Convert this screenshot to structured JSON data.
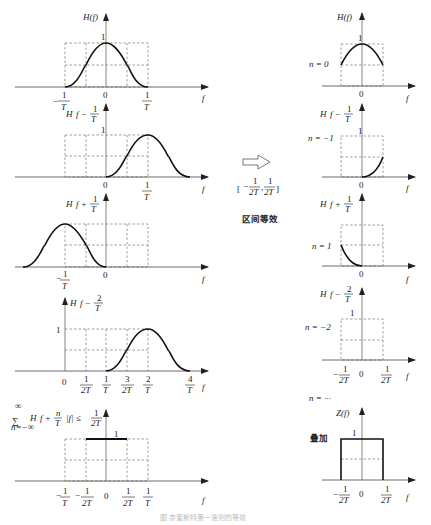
{
  "figure": {
    "arrow_label_interval": "[-1/(2T), 1/(2T)]",
    "arrow_label_text": "区间等效",
    "caption": "图 奈奎斯特第一准则的等效"
  },
  "left_column": {
    "plots": [
      {
        "id": "H(f)",
        "ylabel": "H(f)",
        "peak_label": "1",
        "xticks": [
          "-1/T",
          "0",
          "1/T"
        ],
        "xlabel": "f",
        "center": 0
      },
      {
        "id": "H(f-1/T)",
        "ylabel": "H(f - 1/T)",
        "peak_label": "1",
        "xticks": [
          "0",
          "1/T"
        ],
        "xlabel": "f",
        "center": 1
      },
      {
        "id": "H(f+1/T)",
        "ylabel": "H(f + 1/T)",
        "xticks": [
          "-1/T",
          "0"
        ],
        "xlabel": "f",
        "center": -1
      },
      {
        "id": "H(f-2/T)",
        "ylabel": "H(f - 2/T)",
        "peak_label": "1",
        "xticks": [
          "0",
          "1/2T",
          "1/T",
          "3/2T",
          "2/T",
          "4/T"
        ],
        "xlabel": "f",
        "center": 2
      },
      {
        "id": "sum",
        "ylabel": "Σ H(f + n/T), |f| ≤ 1/2T",
        "sum_limits": {
          "upper": "∞",
          "lower": "n=-∞"
        },
        "peak_label": "1",
        "xticks": [
          "-1/T",
          "-1/2T",
          "0",
          "1/2T",
          "1/T"
        ],
        "xlabel": "f"
      }
    ]
  },
  "right_column": {
    "plots": [
      {
        "ylabel": "H(f)",
        "n_label": "n = 0",
        "peak_label": "1",
        "xticks": [
          "0"
        ],
        "xlabel": "f"
      },
      {
        "ylabel": "H(f - 1/T)",
        "n_label": "n = -1",
        "peak_label": "1",
        "xticks": [
          "0"
        ],
        "xlabel": "f"
      },
      {
        "ylabel": "H(f + 1/T)",
        "n_label": "n = 1",
        "xticks": [
          "0"
        ],
        "xlabel": "f"
      },
      {
        "ylabel": "H(f - 2/T)",
        "n_label": "n = -2",
        "peak_label": "1",
        "xticks": [
          "-1/2T",
          "0",
          "1/2T"
        ],
        "xlabel": "f"
      },
      {
        "ylabel": "Z(f)",
        "n_label": "n = ···",
        "sum_label": "叠加",
        "peak_label": "1",
        "xticks": [
          "-1/2T",
          "0",
          "1/2T"
        ],
        "xlabel": "f"
      }
    ]
  },
  "labels": {
    "one": "1",
    "zero": "0",
    "f": "f",
    "H": "H",
    "Z": "Z",
    "T": "T",
    "twoT": "2T",
    "n0": "n = 0",
    "n_m1": "n = −1",
    "n_p1": "n = 1",
    "n_m2": "n = −2",
    "n_dots": "n = ···",
    "superpose": "叠加",
    "interval_text": "区间等效",
    "num1": "1",
    "num2": "2",
    "num3": "3",
    "num4": "4",
    "minus": "−",
    "inf": "∞",
    "n_lower": "n=−∞",
    "sigma": "∑",
    "cond": "|f| ≤",
    "Hf": "H(f)",
    "Zf": "Z(f)",
    "f_minus": "f −",
    "f_plus": "f +",
    "n": "n"
  }
}
